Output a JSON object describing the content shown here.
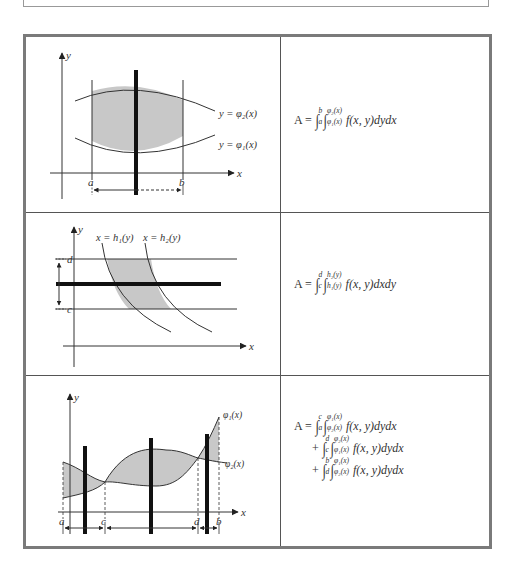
{
  "rows": [
    {
      "diagram": {
        "axis_labels": {
          "x": "x",
          "y": "y"
        },
        "curve_labels": {
          "upper": "y = φ₂(x)",
          "lower": "y = φ₁(x)"
        },
        "bounds": {
          "left": "a",
          "right": "b"
        }
      },
      "formula": {
        "lines": [
          {
            "prefix": "A =",
            "outer": {
              "lower": "a",
              "upper": "b"
            },
            "inner": {
              "lower": "φ₁(x)",
              "upper": "φ₂(x)"
            },
            "body": "f(x, y)dydx"
          }
        ]
      }
    },
    {
      "diagram": {
        "axis_labels": {
          "x": "x",
          "y": "y"
        },
        "curve_labels": {
          "left": "x = h₁(y)",
          "right": "x = h₂(y)"
        },
        "bounds": {
          "top": "d",
          "bottom": "c"
        }
      },
      "formula": {
        "lines": [
          {
            "prefix": "A =",
            "outer": {
              "lower": "c",
              "upper": "d"
            },
            "inner": {
              "lower": "h₁(y)",
              "upper": "h₂(y)"
            },
            "body": "f(x, y)dxdy"
          }
        ]
      }
    },
    {
      "diagram": {
        "axis_labels": {
          "x": "x",
          "y": "y"
        },
        "curve_labels": {
          "first": "φ₁(x)",
          "second": "φ₂(x)"
        },
        "bounds": {
          "a": "a",
          "c": "c",
          "d": "d",
          "b": "b"
        }
      },
      "formula": {
        "lines": [
          {
            "prefix": "A =",
            "outer": {
              "lower": "a",
              "upper": "c"
            },
            "inner": {
              "lower": "φ₂(x)",
              "upper": "φ₁(x)"
            },
            "body": "f(x, y)dydx"
          },
          {
            "prefix": "+",
            "outer": {
              "lower": "c",
              "upper": "d"
            },
            "inner": {
              "lower": "φ₁(x)",
              "upper": "φ₂(x)"
            },
            "body": "f(x, y)dydx"
          },
          {
            "prefix": "+",
            "outer": {
              "lower": "d",
              "upper": "b"
            },
            "inner": {
              "lower": "φ₂(x)",
              "upper": "φ₁(x)"
            },
            "body": "f(x, y)dydx"
          }
        ]
      }
    }
  ],
  "colors": {
    "shade": "#c8c8c8",
    "border": "#7a7a7a",
    "ink": "#222222"
  }
}
